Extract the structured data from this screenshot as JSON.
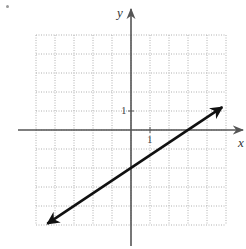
{
  "chart_data": {
    "type": "line",
    "title": "",
    "xlabel": "x",
    "ylabel": "y",
    "xlim": [
      -5,
      5
    ],
    "ylim": [
      -5,
      5
    ],
    "grid": true,
    "grid_style": "dotted",
    "tick_labels": {
      "x": [
        "1"
      ],
      "y": [
        "1"
      ]
    },
    "series": [
      {
        "name": "line",
        "equation": "y = (2/3)x - 2",
        "slope": 0.6667,
        "y_intercept": -2,
        "x_intercept": 3,
        "x": [
          -4.4,
          4.8
        ],
        "y": [
          -4.93,
          1.2
        ],
        "arrows": "both"
      }
    ],
    "legend": null
  },
  "labels": {
    "x_axis": "x",
    "y_axis": "y",
    "x_tick": "1",
    "y_tick": "1"
  },
  "colors": {
    "grid": "#b0b0b0",
    "axis": "#555555",
    "line": "#111111"
  },
  "layout": {
    "origin_px": [
      131,
      130
    ],
    "unit_px": 19,
    "grid_min": -5,
    "grid_max": 5
  }
}
